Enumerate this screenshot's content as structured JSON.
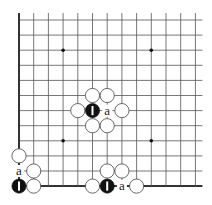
{
  "diagram": {
    "type": "go-board-fragment",
    "grid": {
      "columns": 13,
      "rows": 12,
      "origin_x": 19,
      "origin_y": 20,
      "step_x": 14.7,
      "step_y": 15.1,
      "top_extend": 7,
      "right_extend": 7,
      "edges": [
        "left",
        "bottom"
      ]
    },
    "star_points": [
      {
        "col": 3,
        "row": 2
      },
      {
        "col": 9,
        "row": 2
      },
      {
        "col": 3,
        "row": 8
      },
      {
        "col": 9,
        "row": 8
      }
    ],
    "stones": [
      {
        "color": "white",
        "col": 5,
        "row": 5
      },
      {
        "color": "white",
        "col": 6,
        "row": 5
      },
      {
        "color": "white",
        "col": 4,
        "row": 6
      },
      {
        "color": "black",
        "col": 5,
        "row": 6,
        "label": "1"
      },
      {
        "color": "white",
        "col": 7,
        "row": 6
      },
      {
        "color": "white",
        "col": 5,
        "row": 7
      },
      {
        "color": "white",
        "col": 6,
        "row": 7
      },
      {
        "color": "white",
        "col": 0,
        "row": 9
      },
      {
        "color": "white",
        "col": 1,
        "row": 10
      },
      {
        "color": "black",
        "col": 0,
        "row": 11,
        "label": "1"
      },
      {
        "color": "white",
        "col": 1,
        "row": 11
      },
      {
        "color": "white",
        "col": 6,
        "row": 10
      },
      {
        "color": "white",
        "col": 7,
        "row": 10
      },
      {
        "color": "white",
        "col": 5,
        "row": 11
      },
      {
        "color": "black",
        "col": 6,
        "row": 11,
        "label": "1"
      },
      {
        "color": "white",
        "col": 8,
        "row": 11
      }
    ],
    "labels": [
      {
        "text": "a",
        "col": 6,
        "row": 6
      },
      {
        "text": "a",
        "col": 0,
        "row": 10
      },
      {
        "text": "a",
        "col": 7,
        "row": 11
      }
    ],
    "colors": {
      "line": "#555555",
      "edge": "#333333",
      "black_stone": "#111111",
      "white_stone": "#ffffff",
      "stone_outline": "#444444",
      "label": "#222222"
    }
  }
}
